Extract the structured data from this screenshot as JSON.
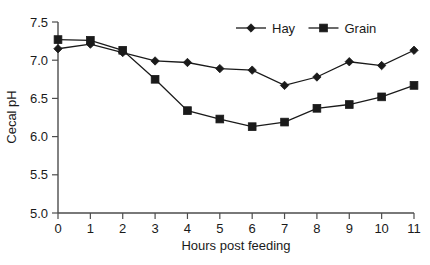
{
  "chart_data": {
    "type": "line",
    "title": "",
    "xlabel": "Hours post feeding",
    "ylabel": "Cecal pH",
    "x": [
      0,
      1,
      2,
      3,
      4,
      5,
      6,
      7,
      8,
      9,
      10,
      11
    ],
    "xlim": [
      0,
      11
    ],
    "ylim": [
      5.0,
      7.5
    ],
    "xticks": [
      "0",
      "1",
      "2",
      "3",
      "4",
      "5",
      "6",
      "7",
      "8",
      "9",
      "10",
      "11"
    ],
    "yticks": [
      "5.0",
      "5.5",
      "6.0",
      "6.5",
      "7.0",
      "7.5"
    ],
    "grid": false,
    "legend_position": "top-right",
    "series": [
      {
        "name": "Hay",
        "marker": "diamond",
        "color": "#1a1a1a",
        "values": [
          7.15,
          7.21,
          7.1,
          6.99,
          6.97,
          6.89,
          6.87,
          6.67,
          6.78,
          6.98,
          6.93,
          7.13
        ]
      },
      {
        "name": "Grain",
        "marker": "square",
        "color": "#1a1a1a",
        "values": [
          7.27,
          7.26,
          7.13,
          6.75,
          6.34,
          6.23,
          6.13,
          6.19,
          6.37,
          6.42,
          6.52,
          6.67
        ]
      }
    ]
  },
  "legend": {
    "items": [
      {
        "label": "Hay",
        "marker": "diamond"
      },
      {
        "label": "Grain",
        "marker": "square"
      }
    ]
  },
  "axes": {
    "y_title": "Cecal pH",
    "x_title": "Hours post feeding"
  }
}
